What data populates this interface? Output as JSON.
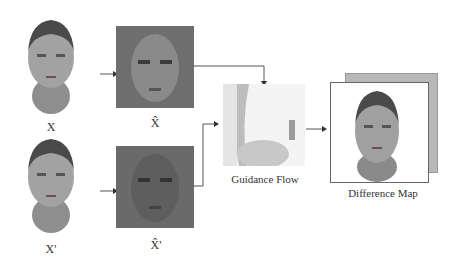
{
  "nodes": {
    "x": {
      "label": "X"
    },
    "x_hat": {
      "label": "X̂"
    },
    "x_prime": {
      "label": "X'"
    },
    "x_hat_prime": {
      "label": "X̂'"
    },
    "guidance_flow": {
      "label": "Guidance Flow"
    },
    "difference_map": {
      "label": "Difference Map"
    }
  },
  "colors": {
    "face_skin": "#9a9a9a",
    "hair": "#4a4a4a",
    "dark_panel": "#6e6e6e",
    "arrow": "#555555"
  }
}
